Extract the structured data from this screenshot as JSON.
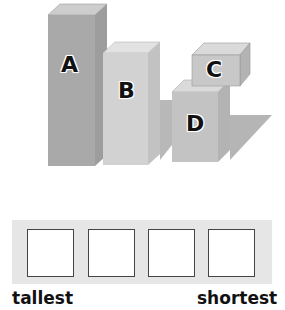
{
  "diagram": {
    "blocks": [
      {
        "label": "A",
        "rank_hint": "tallest"
      },
      {
        "label": "B"
      },
      {
        "label": "C"
      },
      {
        "label": "D"
      }
    ],
    "colors": {
      "block_a_front": "#a9a9a9",
      "block_b_front": "#cfcfcf",
      "block_cd_front": "#c4c4c4",
      "shadow": "#b5b5b5",
      "band": "#e6e6e6"
    }
  },
  "answer": {
    "slots": [
      "",
      "",
      "",
      ""
    ],
    "left_label": "tallest",
    "right_label": "shortest"
  }
}
